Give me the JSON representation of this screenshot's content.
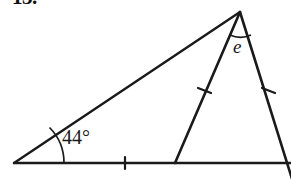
{
  "figure": {
    "problem_number": "13.",
    "background_color": "#ffffff",
    "stroke_color": "#1a1a1a",
    "labels": {
      "base_angle": "44°",
      "apex_angle": "e"
    },
    "geometry": {
      "left_vertex": [
        14,
        163
      ],
      "apex_vertex": [
        240,
        12
      ],
      "cevian_foot": [
        175,
        163
      ],
      "baseline_start": [
        14,
        163
      ],
      "baseline_end": [
        291,
        163
      ],
      "right_side_end": [
        291,
        179
      ]
    },
    "tick_marks": {
      "base_segment": 1,
      "cevian_side": 1,
      "right_side": 1
    },
    "arc_markers": {
      "base_angle_arc": true,
      "apex_angle_arc": true
    }
  }
}
